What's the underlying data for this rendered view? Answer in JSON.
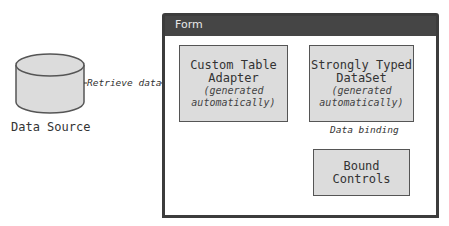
{
  "diagram": {
    "data_source": {
      "label": "Data Source",
      "icon": "database-cylinder-icon"
    },
    "form": {
      "title": "Form"
    },
    "nodes": [
      {
        "id": "adapter",
        "title_line1": "Custom Table",
        "title_line2": "Adapter",
        "sub_line1": "(generated",
        "sub_line2": "automatically)"
      },
      {
        "id": "dataset",
        "title_line1": "Strongly Typed",
        "title_line2": "DataSet",
        "sub_line1": "(generated",
        "sub_line2": "automatically)"
      },
      {
        "id": "controls",
        "title_line1": "Bound",
        "title_line2": "Controls"
      }
    ],
    "edges": [
      {
        "from": "data_source",
        "to": "adapter",
        "label": "Retrieve data",
        "style": "dashed"
      },
      {
        "from": "adapter",
        "to": "dataset",
        "label": ""
      },
      {
        "from": "dataset",
        "to": "controls",
        "label": "Data binding",
        "style": "dashed"
      }
    ],
    "colors": {
      "frame": "#3c3c3c",
      "header": "#454545",
      "node_fill": "#dcdcdc",
      "node_border": "#555555"
    }
  }
}
